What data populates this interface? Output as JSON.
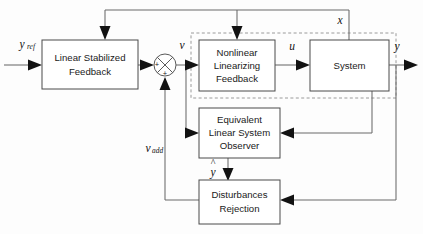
{
  "diagram": {
    "type": "control-block-diagram",
    "canvas": {
      "width": 423,
      "height": 234
    },
    "colors": {
      "background": "#fdfdfd",
      "block_stroke": "#4a4a4a",
      "block_fill": "#ffffff",
      "wire": "#6a6a6a",
      "arrow": "#121212",
      "dashed_boundary": "#9a9a9a",
      "text": "#1a1a1a"
    },
    "blocks": [
      {
        "id": "linear-stabilized-feedback",
        "lines": [
          "Linear Stabilized",
          "Feedback"
        ],
        "x": 42,
        "y": 40,
        "w": 96,
        "h": 49
      },
      {
        "id": "nonlinear-linearizing-feedback",
        "lines": [
          "Nonlinear",
          "Linearizing",
          "Feedback"
        ],
        "x": 199,
        "y": 40,
        "w": 76,
        "h": 51
      },
      {
        "id": "system",
        "lines": [
          "System"
        ],
        "x": 310,
        "y": 40,
        "w": 79,
        "h": 51
      },
      {
        "id": "equivalent-linear-system-observer",
        "lines": [
          "Equivalent",
          "Linear System",
          "Observer"
        ],
        "x": 199,
        "y": 108,
        "w": 81,
        "h": 50
      },
      {
        "id": "disturbances-rejection",
        "lines": [
          "Disturbances",
          "Rejection"
        ],
        "x": 199,
        "y": 180,
        "w": 81,
        "h": 44
      }
    ],
    "dashed_boundary": {
      "id": "feedback-linearized-plant-boundary",
      "x": 191,
      "y": 33,
      "w": 205,
      "h": 65
    },
    "summing_junction": {
      "id": "summing-junction",
      "cx": 165,
      "cy": 65,
      "r": 11,
      "signs": [
        {
          "label": "+",
          "x": 156,
          "y": 65
        },
        {
          "label": "+",
          "x": 165,
          "y": 75
        }
      ]
    },
    "signals": [
      {
        "id": "y-ref",
        "base": "y",
        "sub": "ref",
        "x": 24,
        "y": 44
      },
      {
        "id": "v",
        "base": "v",
        "sub": "",
        "x": 182,
        "y": 45
      },
      {
        "id": "u",
        "base": "u",
        "sub": "",
        "x": 292,
        "y": 46
      },
      {
        "id": "x",
        "base": "x",
        "sub": "",
        "x": 339,
        "y": 20
      },
      {
        "id": "y-out",
        "base": "y",
        "sub": "",
        "x": 396,
        "y": 46
      },
      {
        "id": "v-add",
        "base": "v",
        "sub": "add",
        "x": 152,
        "y": 150
      },
      {
        "id": "y-hat",
        "base": "y",
        "sub": "",
        "x": 213,
        "y": 170,
        "hat": true
      }
    ],
    "connections": [
      {
        "id": "yref-to-linear-stabilized-feedback",
        "from": "input",
        "to": "linear-stabilized-feedback"
      },
      {
        "id": "linear-stabilized-feedback-to-sum",
        "from": "linear-stabilized-feedback",
        "to": "summing-junction"
      },
      {
        "id": "sum-to-nonlinear-linearizing-feedback",
        "from": "summing-junction",
        "to": "nonlinear-linearizing-feedback",
        "signal": "v"
      },
      {
        "id": "v-branch-to-observer",
        "from": "summing-junction",
        "to": "equivalent-linear-system-observer",
        "signal": "v"
      },
      {
        "id": "nonlinear-to-system",
        "from": "nonlinear-linearizing-feedback",
        "to": "system",
        "signal": "u"
      },
      {
        "id": "system-to-output",
        "from": "system",
        "to": "output",
        "signal": "y"
      },
      {
        "id": "x-state-to-nonlinear-linearizing-feedback",
        "from": "system",
        "to": "nonlinear-linearizing-feedback",
        "signal": "x"
      },
      {
        "id": "x-state-to-linear-stabilized-feedback",
        "from": "system",
        "to": "linear-stabilized-feedback",
        "signal": "x"
      },
      {
        "id": "y-to-observer",
        "from": "output",
        "to": "equivalent-linear-system-observer",
        "signal": "y"
      },
      {
        "id": "y-to-disturbances-rejection",
        "from": "output",
        "to": "disturbances-rejection",
        "signal": "y"
      },
      {
        "id": "observer-to-disturbances-rejection",
        "from": "equivalent-linear-system-observer",
        "to": "disturbances-rejection",
        "signal": "y-hat"
      },
      {
        "id": "disturbances-rejection-to-sum",
        "from": "disturbances-rejection",
        "to": "summing-junction",
        "signal": "v-add"
      }
    ]
  }
}
